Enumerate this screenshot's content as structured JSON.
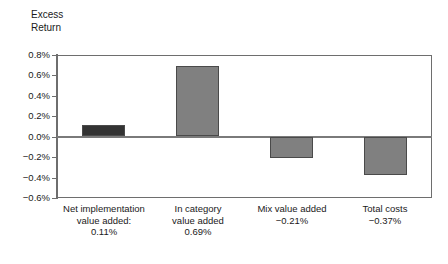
{
  "chart_data": {
    "type": "bar",
    "title": "",
    "subtitle": "",
    "xlabel": "",
    "ylabel": "Excess\nReturn",
    "ylim": [
      -0.6,
      0.8
    ],
    "ytick_step": 0.2,
    "grid": false,
    "legend": null,
    "value_suffix": "%",
    "categories": [
      "Net implementation\nvalue added:\n0.11%",
      "In category\nvalue added\n0.69%",
      "Mix value added\n−0.21%",
      "Total costs\n−0.37%"
    ],
    "values": [
      0.11,
      0.69,
      -0.21,
      -0.37
    ],
    "ytick_labels": [
      "0.8%",
      "0.6%",
      "0.4%",
      "0.2%",
      "0.0%",
      "−0.2%",
      "−0.4%",
      "−0.6%"
    ],
    "ytick_values": [
      0.8,
      0.6,
      0.4,
      0.2,
      0.0,
      -0.2,
      -0.4,
      -0.6
    ],
    "bar_colors": [
      "#333333",
      "#808080",
      "#808080",
      "#808080"
    ],
    "bar_border_color": "#4a4a4a",
    "axis_color": "#6e6e6e",
    "zero_line_color": "#7a7a7a",
    "background_color": "#ffffff"
  }
}
